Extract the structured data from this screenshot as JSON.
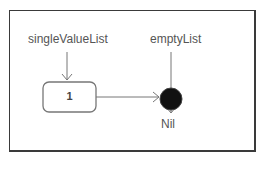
{
  "diagram": {
    "pointers": [
      {
        "label": "singleValueList",
        "target": "node-1"
      },
      {
        "label": "emptyList",
        "target": "nil"
      }
    ],
    "nodes": [
      {
        "id": "node-1",
        "value": "1",
        "next": "nil"
      }
    ],
    "terminal": {
      "id": "nil",
      "label": "Nil",
      "color": "#111111"
    },
    "colors": {
      "stroke": "#777777",
      "border": "#3a3a3a"
    }
  }
}
